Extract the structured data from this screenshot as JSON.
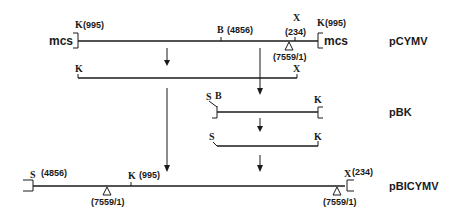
{
  "constructs": {
    "pcymv": {
      "name": "pCYMV",
      "mcs_left": "mcs",
      "mcs_right": "mcs",
      "k_left": "K",
      "k_left_pos": "(995)",
      "b_site": "B",
      "b_pos": "(4856)",
      "x_site": "X",
      "x_pos": "(234)",
      "junction": "(7559/1)",
      "k_right": "K",
      "k_right_pos": "(995)"
    },
    "fragment_kx": {
      "k_site": "K",
      "x_site": "X"
    },
    "pbk": {
      "name": "pBK",
      "s_site": "S",
      "b_site": "B",
      "k_site": "K"
    },
    "fragment_sk": {
      "s_site": "S",
      "k_site": "K"
    },
    "pbicymv": {
      "name": "pBICYMV",
      "s_site": "S",
      "s_pos": "(4856)",
      "junction_left": "(7559/1)",
      "k_site": "K",
      "k_pos": "(995)",
      "x_site": "X",
      "x_pos": "(234)",
      "junction_right": "(7559/1)"
    }
  }
}
